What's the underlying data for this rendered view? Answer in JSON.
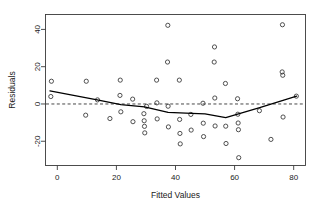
{
  "chart_data": {
    "type": "scatter",
    "title": "",
    "xlabel": "Fitted Values",
    "ylabel": "Residuals",
    "xlim": [
      -4,
      84
    ],
    "ylim": [
      -33,
      48
    ],
    "xticks": [
      0,
      20,
      40,
      60,
      80
    ],
    "yticks": [
      -20,
      0,
      20,
      40
    ],
    "xtick_labels": [
      "0",
      "20",
      "40",
      "60",
      "80"
    ],
    "ytick_labels": [
      "-20",
      "0",
      "20",
      "40"
    ],
    "grid": false,
    "legend": null,
    "point_marker": "open-circle",
    "point_color": "#333333",
    "reference_line": {
      "type": "horizontal",
      "y": 0,
      "style": "dashed",
      "color": "#333333"
    },
    "smoother": {
      "name": "lowess",
      "style": "solid",
      "color": "#000000",
      "x": [
        -2.5,
        13.5,
        21.5,
        29.5,
        37.5,
        45.5,
        50.0,
        57.0,
        68.5,
        81.0
      ],
      "y": [
        7.0,
        2.2,
        -0.3,
        -1.5,
        -4.5,
        -5.0,
        -5.3,
        -7.3,
        -2.0,
        4.2
      ]
    },
    "points": [
      {
        "x": -2.0,
        "y": 12.2
      },
      {
        "x": -2.2,
        "y": 4.0
      },
      {
        "x": 9.8,
        "y": 12.2
      },
      {
        "x": 9.6,
        "y": -6.0
      },
      {
        "x": 13.6,
        "y": 2.2
      },
      {
        "x": 17.8,
        "y": -7.8
      },
      {
        "x": 21.3,
        "y": 12.8
      },
      {
        "x": 21.2,
        "y": 4.6
      },
      {
        "x": 21.5,
        "y": -4.2
      },
      {
        "x": 25.5,
        "y": 2.6
      },
      {
        "x": 25.6,
        "y": -9.5
      },
      {
        "x": 29.3,
        "y": -5.2
      },
      {
        "x": 29.4,
        "y": -9.0
      },
      {
        "x": 29.5,
        "y": -12.0
      },
      {
        "x": 29.6,
        "y": -15.5
      },
      {
        "x": 30.2,
        "y": -1.3
      },
      {
        "x": 33.6,
        "y": 12.8
      },
      {
        "x": 33.7,
        "y": 0.6
      },
      {
        "x": 33.8,
        "y": -8.0
      },
      {
        "x": 37.4,
        "y": 42.2
      },
      {
        "x": 37.3,
        "y": 22.5
      },
      {
        "x": 37.5,
        "y": -1.2
      },
      {
        "x": 37.6,
        "y": -12.3
      },
      {
        "x": 41.3,
        "y": 12.8
      },
      {
        "x": 41.4,
        "y": -8.3
      },
      {
        "x": 41.5,
        "y": -15.8
      },
      {
        "x": 41.6,
        "y": -21.4
      },
      {
        "x": 45.2,
        "y": -5.6
      },
      {
        "x": 45.3,
        "y": -14.0
      },
      {
        "x": 49.3,
        "y": 0.4
      },
      {
        "x": 49.4,
        "y": -10.3
      },
      {
        "x": 49.5,
        "y": -17.5
      },
      {
        "x": 53.2,
        "y": 30.6
      },
      {
        "x": 53.1,
        "y": 22.5
      },
      {
        "x": 53.3,
        "y": 3.2
      },
      {
        "x": 53.4,
        "y": -11.8
      },
      {
        "x": 56.9,
        "y": 11.0
      },
      {
        "x": 57.0,
        "y": -11.9
      },
      {
        "x": 57.1,
        "y": -21.2
      },
      {
        "x": 61.0,
        "y": 2.8
      },
      {
        "x": 61.1,
        "y": -5.5
      },
      {
        "x": 61.2,
        "y": -10.2
      },
      {
        "x": 61.3,
        "y": -13.8
      },
      {
        "x": 61.4,
        "y": -28.8
      },
      {
        "x": 68.4,
        "y": -3.6
      },
      {
        "x": 72.3,
        "y": -19.0
      },
      {
        "x": 76.2,
        "y": 42.5
      },
      {
        "x": 76.1,
        "y": 17.2
      },
      {
        "x": 76.3,
        "y": 15.4
      },
      {
        "x": 76.4,
        "y": -7.0
      },
      {
        "x": 80.9,
        "y": 4.2
      }
    ]
  },
  "axes": {
    "x_title": "Fitted Values",
    "y_title": "Residuals"
  }
}
